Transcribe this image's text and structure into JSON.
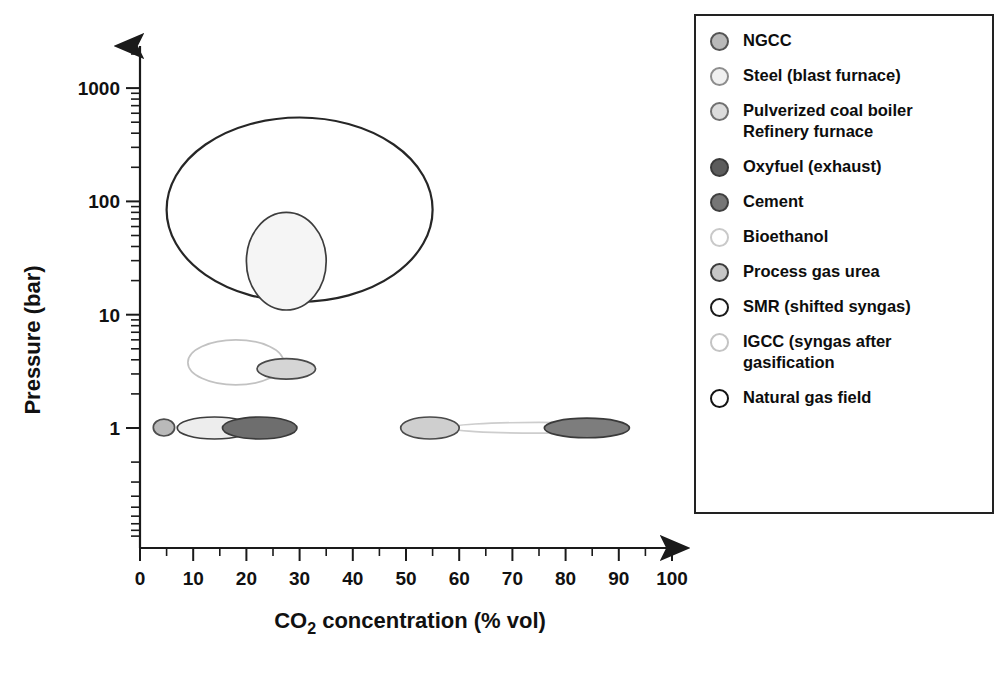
{
  "chart_data": {
    "type": "scatter",
    "title": "",
    "xlabel": "CO2 concentration (% vol)",
    "xlabel_parts": {
      "pre": "CO",
      "sub": "2",
      "post": " concentration (% vol)"
    },
    "ylabel": "Pressure (bar)",
    "xlim": [
      0,
      100
    ],
    "ylim": [
      0.2,
      2000
    ],
    "yscale": "log",
    "xticks": [
      "0",
      "10",
      "20",
      "30",
      "40",
      "50",
      "60",
      "70",
      "80",
      "90",
      "100"
    ],
    "yticks": [
      "1",
      "10",
      "100",
      "1000"
    ],
    "grid": false,
    "legend_position": "right-outside",
    "series": [
      {
        "name": "NGCC",
        "fill": "#b9b9b9",
        "stroke": "#4d4d4d",
        "x_center": 4.5,
        "x_range": [
          2.5,
          6.5
        ],
        "y_center": 1,
        "y_range": [
          0.85,
          1.2
        ],
        "shape": "ellipse"
      },
      {
        "name": "Steel (blast furnace)",
        "fill": "#ededed",
        "stroke": "#3d3d3d",
        "x_center": 14,
        "x_range": [
          7,
          21
        ],
        "y_center": 1,
        "y_range": [
          0.8,
          1.25
        ],
        "shape": "ellipse"
      },
      {
        "name": "Pulverized coal boiler\nRefinery furnace",
        "fill": "#d5d5d5",
        "stroke": "#4a4a4a",
        "x_center": 27.5,
        "x_range": [
          22,
          33
        ],
        "y_center": 3.3,
        "y_range": [
          2.7,
          4.1
        ],
        "shape": "ellipse"
      },
      {
        "name": "Oxyfuel (exhaust)",
        "fill": "#6e6e6e",
        "stroke": "#3a3a3a",
        "x_center": 22.5,
        "x_range": [
          15.5,
          29.5
        ],
        "y_center": 1,
        "y_range": [
          0.8,
          1.25
        ],
        "shape": "ellipse"
      },
      {
        "name": "Cement",
        "fill": "#7d7d7d",
        "stroke": "#3a3a3a",
        "x_center": 84,
        "x_range": [
          76,
          92
        ],
        "y_center": 1,
        "y_range": [
          0.82,
          1.22
        ],
        "shape": "ellipse"
      },
      {
        "name": "Bioethanol",
        "fill": "#ffffff",
        "stroke": "#c2c2c2",
        "x_center": 18,
        "x_range": [
          9,
          27
        ],
        "y_center": 3.8,
        "y_range": [
          2.4,
          6.0
        ],
        "shape": "ellipse"
      },
      {
        "name": "Process gas urea",
        "fill": "#cfcfcf",
        "stroke": "#4a4a4a",
        "x_center": 54.5,
        "x_range": [
          49,
          60
        ],
        "y_center": 1,
        "y_range": [
          0.8,
          1.25
        ],
        "shape": "ellipse"
      },
      {
        "name": "SMR (shifted syngas)",
        "fill": "none",
        "stroke": "#262626",
        "x_center": 30,
        "x_range": [
          5,
          55
        ],
        "y_center": 85,
        "y_range": [
          13,
          550
        ],
        "shape": "ellipse"
      },
      {
        "name": "IGCC (syngas after\ngasification",
        "fill": "#f5f5f5",
        "stroke": "#3d3d3d",
        "x_center": 27.5,
        "x_range": [
          20,
          35
        ],
        "y_center": 30,
        "y_range": [
          11,
          80
        ],
        "shape": "circle"
      },
      {
        "name": "Natural gas field",
        "fill": "none",
        "stroke": "#cdcdcd",
        "x_center": 75,
        "x_range": [
          58,
          92
        ],
        "y_center": 1,
        "y_range": [
          0.9,
          1.12
        ],
        "shape": "ellipse"
      }
    ],
    "annotations": []
  },
  "legend": {
    "items": [
      {
        "label": "NGCC",
        "fill": "#b9b9b9",
        "stroke": "#545454"
      },
      {
        "label": "Steel (blast furnace)",
        "fill": "#f0f0f0",
        "stroke": "#8d8d8d"
      },
      {
        "label": "Pulverized coal boiler\nRefinery furnace",
        "fill": "#dcdcdc",
        "stroke": "#707070"
      },
      {
        "label": "Oxyfuel (exhaust)",
        "fill": "#5c5c5c",
        "stroke": "#3a3a3a"
      },
      {
        "label": "Cement",
        "fill": "#767676",
        "stroke": "#3f3f3f"
      },
      {
        "label": "Bioethanol",
        "fill": "#ffffff",
        "stroke": "#c9c9c9"
      },
      {
        "label": "Process gas urea",
        "fill": "#c6c6c6",
        "stroke": "#3c3c3c"
      },
      {
        "label": "SMR (shifted syngas)",
        "fill": "#ffffff",
        "stroke": "#1b1b1b"
      },
      {
        "label": "IGCC (syngas after\ngasification",
        "fill": "#ffffff",
        "stroke": "#c4c4c4"
      },
      {
        "label": "Natural gas field",
        "fill": "#ffffff",
        "stroke": "#131313"
      }
    ]
  },
  "axes": {
    "y_title": "Pressure (bar)",
    "y_labels": [
      "1000",
      "100",
      "10",
      "1"
    ],
    "x_labels": [
      "0",
      "10",
      "20",
      "30",
      "40",
      "50",
      "60",
      "70",
      "80",
      "90",
      "100"
    ],
    "x_title_pre": "CO",
    "x_title_sub": "2",
    "x_title_post": " concentration (% vol)"
  }
}
